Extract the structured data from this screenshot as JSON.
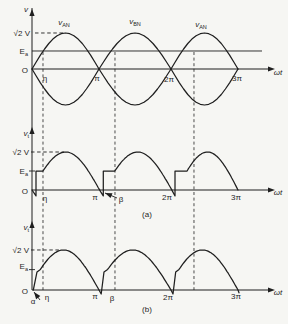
{
  "figure": {
    "kind": "textbook-waveform-figure",
    "captions": {
      "a": "(a)",
      "b": "(b)"
    },
    "x_axis_label": "ωt",
    "y_levels": {
      "peak_label": "√2 V",
      "battery_label": "Ea",
      "origin_label": "O"
    }
  },
  "layout": {
    "w": 288,
    "h": 324,
    "x_anchors": [
      32,
      99,
      171,
      238
    ],
    "colors": {
      "ink": "#1f1f1f",
      "paper": "#f6f6f3"
    },
    "y_axis": {
      "x": 32,
      "y1": 8,
      "y2": 290,
      "arrow_tips_y": [
        9,
        127,
        221
      ]
    },
    "x_axis_end": 268,
    "x_arrow_tip": 275,
    "dashed_verticals": {
      "x_pi": [
        0.164,
        1.222,
        2.343
      ],
      "y_top": 52,
      "y_bottom": 290
    }
  },
  "chart_data": [
    {
      "type": "line",
      "title": "Transformer secondary phase voltages",
      "xlabel": "ωt",
      "ylabel": "v",
      "x_range_pi": [
        0,
        3
      ],
      "ylim": [
        -1.414,
        1.414
      ],
      "amplitude_V": 1.414,
      "battery_Ea_V": 0.707,
      "cut_in_eta_deg": 30,
      "xticks": [
        "η",
        "π",
        "2π",
        "3π"
      ],
      "yticks": [
        "√2 V",
        "Ea",
        "O"
      ],
      "legend_position": "above-curves",
      "grid": false,
      "series": [
        {
          "name": "vAN",
          "formula": "√2·V·sin(ωt)",
          "segments": [
            {
              "t": "sine",
              "x": [
                0,
                3
              ],
              "th": [
                0,
                540
              ],
              "amp": 1.414
            }
          ]
        },
        {
          "name": "vBN",
          "formula": "-√2·V·sin(ωt)",
          "segments": [
            {
              "t": "sine",
              "x": [
                0,
                3
              ],
              "th": [
                0,
                540
              ],
              "amp": -1.414
            }
          ]
        }
      ]
    },
    {
      "type": "line",
      "title": "Rectified output voltage, case (a)",
      "xlabel": "ωt",
      "ylabel": "vt",
      "x_range_pi": [
        0,
        3
      ],
      "ylim": [
        -0.25,
        1.414
      ],
      "battery_Ea_V": 0.707,
      "cut_in_eta_deg": 30,
      "extinction_beta_deg": 189,
      "xticks": [
        "η",
        "π",
        "β",
        "2π",
        "3π"
      ],
      "yticks": [
        "√2 V",
        "Ea",
        "O"
      ],
      "grid": false,
      "series": [
        {
          "name": "vt",
          "segments": [
            {
              "t": "move",
              "p": [
                0,
                0
              ]
            },
            {
              "t": "line",
              "p": [
                0.06,
                -0.22
              ]
            },
            {
              "t": "line",
              "p": [
                0.06,
                0.707
              ]
            },
            {
              "t": "line",
              "p": [
                0.164,
                0.707
              ]
            },
            {
              "t": "sine",
              "x": [
                0.164,
                1.06
              ],
              "th": [
                30,
                189
              ],
              "amp": 1.414
            },
            {
              "t": "line",
              "p": [
                1.06,
                0.707
              ]
            },
            {
              "t": "line",
              "p": [
                1.22,
                0.707
              ]
            },
            {
              "t": "sine",
              "x": [
                1.22,
                2.06
              ],
              "th": [
                30,
                189
              ],
              "amp": 1.414
            },
            {
              "t": "line",
              "p": [
                2.06,
                0.707
              ]
            },
            {
              "t": "line",
              "p": [
                2.24,
                0.707
              ]
            },
            {
              "t": "sine",
              "x": [
                2.24,
                3.0
              ],
              "th": [
                30,
                180
              ],
              "amp": 1.414
            }
          ]
        }
      ]
    },
    {
      "type": "line",
      "title": "Rectified output voltage, case (b)",
      "xlabel": "ωt",
      "ylabel": "vt",
      "x_range_pi": [
        0,
        3
      ],
      "ylim": [
        -0.25,
        1.414
      ],
      "battery_Ea_V": 0.707,
      "start_alpha_deg": 4,
      "xticks": [
        "α",
        "η",
        "π",
        "β",
        "2π",
        "3π"
      ],
      "yticks": [
        "√2 V",
        "Ea",
        "O"
      ],
      "grid": false,
      "series": [
        {
          "name": "vt",
          "segments": [
            {
              "t": "move",
              "p": [
                0.02,
                0
              ]
            },
            {
              "t": "line",
              "p": [
                0.075,
                0.64
              ]
            },
            {
              "t": "line",
              "p": [
                0.125,
                0.728
              ]
            },
            {
              "t": "sine",
              "x": [
                0.125,
                1.0
              ],
              "th": [
                31,
                180
              ],
              "amp": 1.414
            },
            {
              "t": "line",
              "p": [
                1.03,
                -0.14
              ]
            },
            {
              "t": "line",
              "p": [
                1.07,
                0.64
              ]
            },
            {
              "t": "line",
              "p": [
                1.12,
                0.728
              ]
            },
            {
              "t": "sine",
              "x": [
                1.12,
                2.0
              ],
              "th": [
                31,
                180
              ],
              "amp": 1.414
            },
            {
              "t": "line",
              "p": [
                2.03,
                -0.14
              ]
            },
            {
              "t": "line",
              "p": [
                2.07,
                0.64
              ]
            },
            {
              "t": "line",
              "p": [
                2.12,
                0.728
              ]
            },
            {
              "t": "sine",
              "x": [
                2.12,
                3.0
              ],
              "th": [
                31,
                180
              ],
              "amp": 1.414
            },
            {
              "t": "line",
              "p": [
                3.015,
                -0.1
              ]
            }
          ]
        }
      ]
    }
  ],
  "panels": [
    {
      "id": "top",
      "chart": 0,
      "axis_y": 69,
      "ppv": 25.46,
      "ea_line": {
        "v": 0.707,
        "x": [
          32,
          262
        ]
      },
      "sqrt2_dash": {
        "v": 1.414,
        "x": [
          35,
          63
        ]
      },
      "labels": [
        {
          "id": "v-axis-label",
          "x": 26,
          "y": 12,
          "a": "m",
          "parts": [
            {
              "t": "v",
              "it": 1
            }
          ]
        },
        {
          "id": "curve-label-van-1",
          "x": 64,
          "y": 25,
          "a": "m",
          "parts": [
            {
              "t": "v",
              "it": 1
            },
            {
              "t": "AN",
              "sub": 1
            }
          ]
        },
        {
          "id": "curve-label-vbn",
          "x": 135,
          "y": 24,
          "a": "m",
          "parts": [
            {
              "t": "v",
              "it": 1
            },
            {
              "t": "BN",
              "sub": 1
            }
          ]
        },
        {
          "id": "curve-label-van-2",
          "x": 201,
          "y": 27,
          "a": "m",
          "parts": [
            {
              "t": "v",
              "it": 1
            },
            {
              "t": "AN",
              "sub": 1
            }
          ]
        },
        {
          "id": "ytick-sqrt2v",
          "x": 30,
          "y": 36,
          "a": "e",
          "parts": [
            {
              "t": "√2 V"
            }
          ]
        },
        {
          "id": "ytick-ea",
          "x": 28,
          "y": 54,
          "a": "e",
          "parts": [
            {
              "t": "E"
            },
            {
              "t": "a",
              "sub": 1
            }
          ]
        },
        {
          "id": "ytick-o",
          "x": 28,
          "y": 73,
          "a": "e",
          "parts": [
            {
              "t": "O"
            }
          ]
        },
        {
          "id": "xtick-eta",
          "x": 45,
          "y": 81,
          "a": "m",
          "parts": [
            {
              "t": "η"
            }
          ]
        },
        {
          "id": "xtick-pi",
          "x": 97,
          "y": 81,
          "a": "m",
          "parts": [
            {
              "t": "π"
            }
          ]
        },
        {
          "id": "xtick-2pi",
          "x": 169,
          "y": 82,
          "a": "m",
          "parts": [
            {
              "t": "2π"
            }
          ]
        },
        {
          "id": "xtick-3pi",
          "x": 237,
          "y": 81,
          "a": "m",
          "parts": [
            {
              "t": "3π"
            }
          ]
        },
        {
          "id": "xaxis-label-wt",
          "x": 278,
          "y": 75,
          "a": "m",
          "parts": [
            {
              "t": "ωt",
              "it": 1
            }
          ]
        }
      ]
    },
    {
      "id": "middle",
      "chart": 1,
      "axis_y": 190,
      "ppv": 26.87,
      "ea_tick": {
        "v": 0.707,
        "x": [
          29,
          35
        ]
      },
      "sqrt2_dash": {
        "v": 1.414,
        "x": [
          31,
          64
        ]
      },
      "labels": [
        {
          "id": "vt-axis-label-a",
          "x": 29,
          "y": 136,
          "a": "e",
          "parts": [
            {
              "t": "v",
              "it": 1
            },
            {
              "t": "t",
              "sub": 1
            }
          ]
        },
        {
          "id": "ytick-sqrt2v-a",
          "x": 29,
          "y": 155,
          "a": "e",
          "parts": [
            {
              "t": "√2 V"
            }
          ]
        },
        {
          "id": "ytick-ea-a",
          "x": 28,
          "y": 174,
          "a": "e",
          "parts": [
            {
              "t": "E"
            },
            {
              "t": "a",
              "sub": 1
            }
          ]
        },
        {
          "id": "ytick-o-a",
          "x": 28,
          "y": 194,
          "a": "e",
          "parts": [
            {
              "t": "O"
            }
          ]
        },
        {
          "id": "xtick-eta-a",
          "x": 45,
          "y": 201,
          "a": "m",
          "parts": [
            {
              "t": "η"
            }
          ]
        },
        {
          "id": "xtick-pi-a",
          "x": 95,
          "y": 200,
          "a": "m",
          "parts": [
            {
              "t": "π"
            }
          ]
        },
        {
          "id": "xtick-beta-a",
          "x": 121,
          "y": 202,
          "a": "m",
          "parts": [
            {
              "t": "β"
            }
          ]
        },
        {
          "id": "xtick-2pi-a",
          "x": 167,
          "y": 200,
          "a": "m",
          "parts": [
            {
              "t": "2π"
            }
          ]
        },
        {
          "id": "xtick-3pi-a",
          "x": 236,
          "y": 200,
          "a": "m",
          "parts": [
            {
              "t": "3π"
            }
          ]
        },
        {
          "id": "xaxis-label-wt-a",
          "x": 278,
          "y": 195,
          "a": "m",
          "parts": [
            {
              "t": "ωt",
              "it": 1
            }
          ]
        },
        {
          "id": "caption-a",
          "x": 147,
          "y": 217,
          "a": "m",
          "parts": [
            {
              "t": "(a)"
            }
          ]
        }
      ]
    },
    {
      "id": "bottom",
      "chart": 2,
      "axis_y": 290,
      "ppv": 28.3,
      "ea_tick": {
        "v": 0.72,
        "x": [
          29,
          35
        ]
      },
      "sqrt2_dash": {
        "v": 1.414,
        "x": [
          31,
          60
        ]
      },
      "labels": [
        {
          "id": "vt-axis-label-b",
          "x": 29,
          "y": 230,
          "a": "e",
          "parts": [
            {
              "t": "v",
              "it": 1
            },
            {
              "t": "t",
              "sub": 1
            }
          ]
        },
        {
          "id": "ytick-sqrt2v-b",
          "x": 29,
          "y": 253,
          "a": "e",
          "parts": [
            {
              "t": "√2 V"
            }
          ]
        },
        {
          "id": "ytick-ea-b",
          "x": 28,
          "y": 269,
          "a": "e",
          "parts": [
            {
              "t": "E"
            },
            {
              "t": "a",
              "sub": 1
            }
          ]
        },
        {
          "id": "ytick-o-b",
          "x": 28,
          "y": 294,
          "a": "e",
          "parts": [
            {
              "t": "O"
            }
          ]
        },
        {
          "id": "xtick-alpha-b",
          "x": 33,
          "y": 304,
          "a": "m",
          "parts": [
            {
              "t": "α"
            }
          ]
        },
        {
          "id": "xtick-eta-b",
          "x": 47,
          "y": 300,
          "a": "m",
          "parts": [
            {
              "t": "η"
            }
          ]
        },
        {
          "id": "xtick-pi-b",
          "x": 95,
          "y": 299,
          "a": "m",
          "parts": [
            {
              "t": "π"
            }
          ]
        },
        {
          "id": "xtick-beta-b",
          "x": 112,
          "y": 301,
          "a": "m",
          "parts": [
            {
              "t": "β"
            }
          ]
        },
        {
          "id": "xtick-2pi-b",
          "x": 168,
          "y": 300,
          "a": "m",
          "parts": [
            {
              "t": "2π"
            }
          ]
        },
        {
          "id": "xtick-3pi-b",
          "x": 236,
          "y": 299,
          "a": "m",
          "parts": [
            {
              "t": "3π"
            }
          ]
        },
        {
          "id": "xaxis-label-wt-b",
          "x": 278,
          "y": 295,
          "a": "m",
          "parts": [
            {
              "t": "ωt",
              "it": 1
            }
          ]
        },
        {
          "id": "caption-b",
          "x": 147,
          "y": 312,
          "a": "m",
          "parts": [
            {
              "t": "(b)"
            }
          ]
        }
      ]
    }
  ],
  "annotation_arrows": [
    {
      "id": "beta-pointer-a",
      "from": [
        117,
        198
      ],
      "to": [
        105,
        193
      ]
    },
    {
      "id": "alpha-pointer-b",
      "from": [
        40,
        300
      ],
      "to": [
        34,
        292
      ]
    }
  ]
}
